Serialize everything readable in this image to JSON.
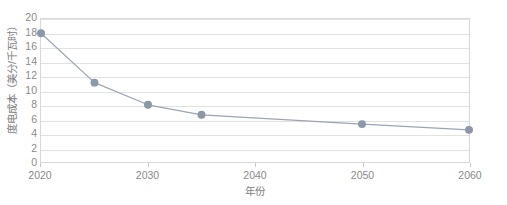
{
  "chart_data": {
    "type": "line",
    "title": "",
    "xlabel": "年份",
    "ylabel": "度电成本（美分/千瓦时）",
    "x": [
      2020,
      2025,
      2030,
      2035,
      2050,
      2060
    ],
    "values": [
      18.0,
      11.1,
      8.0,
      6.6,
      5.3,
      4.5
    ],
    "series": [
      {
        "name": "度电成本",
        "values": [
          18.0,
          11.1,
          8.0,
          6.6,
          5.3,
          4.5
        ]
      }
    ],
    "xlim": [
      2020,
      2060
    ],
    "ylim": [
      0,
      20
    ],
    "xticks": [
      2020,
      2030,
      2040,
      2050,
      2060
    ],
    "xtick_labels": [
      "2020",
      "2030",
      "2040",
      "2050",
      "2060"
    ],
    "yticks": [
      0,
      2,
      4,
      6,
      8,
      10,
      12,
      14,
      16,
      18,
      20
    ],
    "ytick_labels": [
      "0",
      "2",
      "4",
      "6",
      "8",
      "10",
      "12",
      "14",
      "16",
      "18",
      "20"
    ],
    "grid": "horizontal",
    "legend": "none",
    "marker": "circle",
    "colors": {
      "line": "#9aa5b4",
      "marker": "#8c97a8",
      "grid": "#e2e2e2",
      "border": "#d8d8d8",
      "tick_text": "#8a8a8a",
      "axis_title": "#7d7d7d",
      "background": "#ffffff"
    }
  }
}
